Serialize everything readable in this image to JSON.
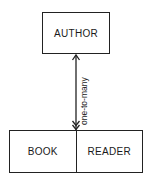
{
  "entities": {
    "top": {
      "label": "AUTHOR"
    },
    "bottom_left": {
      "label": "BOOK"
    },
    "bottom_right": {
      "label": "READER"
    }
  },
  "relationship": {
    "label": "one-to-many",
    "from": "AUTHOR",
    "to": "BOOK/READER",
    "top_end": "single-arrow",
    "bottom_end": "double-arrow"
  },
  "colors": {
    "line": "#222222",
    "background": "#ffffff"
  }
}
